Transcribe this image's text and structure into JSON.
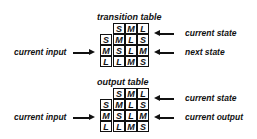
{
  "tables": [
    {
      "title": "transition table",
      "header": [
        "S",
        "M",
        "L"
      ],
      "rows": [
        {
          "input": "S",
          "values": [
            "M",
            "L",
            "S"
          ]
        },
        {
          "input": "M",
          "values": [
            "S",
            "L",
            "M"
          ]
        },
        {
          "input": "L",
          "values": [
            "L",
            "M",
            "S"
          ]
        }
      ],
      "labels": {
        "left": "current input",
        "top_right": "current state",
        "middle_right": "next state"
      }
    },
    {
      "title": "output table",
      "header": [
        "S",
        "M",
        "L"
      ],
      "rows": [
        {
          "input": "S",
          "values": [
            "M",
            "L",
            "S"
          ]
        },
        {
          "input": "M",
          "values": [
            "S",
            "L",
            "M"
          ]
        },
        {
          "input": "L",
          "values": [
            "L",
            "M",
            "S"
          ]
        }
      ],
      "labels": {
        "left": "current input",
        "top_right": "current state",
        "middle_right": "current output"
      }
    }
  ]
}
